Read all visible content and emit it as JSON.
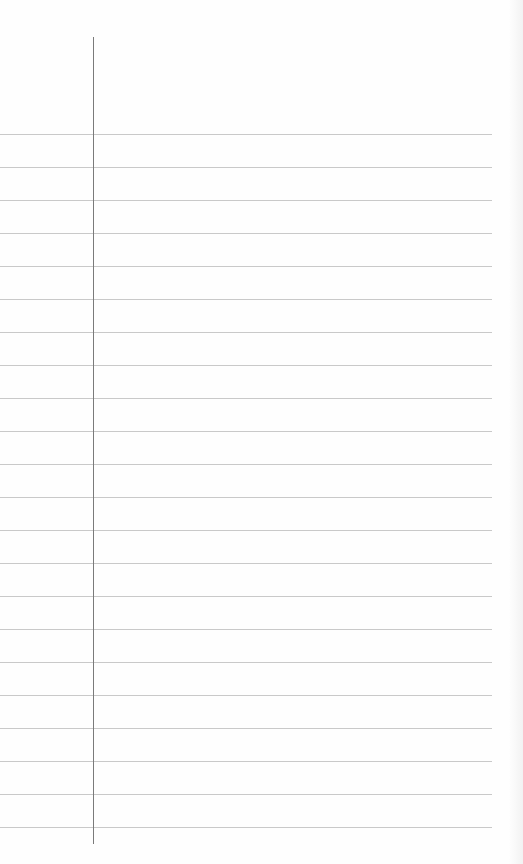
{
  "paper": {
    "type": "lined-notebook-page",
    "background_color": "#fefefe",
    "rule_color": "#c9c9c9",
    "margin_line_color": "#7a7a7a",
    "rule_count": 22,
    "rule_spacing_px": 33,
    "first_rule_y": 134,
    "margin_line_x": 93,
    "text_content": ""
  }
}
